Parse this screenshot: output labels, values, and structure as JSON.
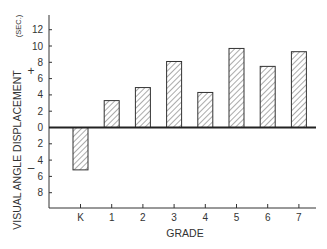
{
  "chart_data": {
    "type": "bar",
    "title": "",
    "xlabel": "GRADE",
    "ylabel": "VISUAL ANGLE DISPLACEMENT",
    "ylabel_unit": "(SEC.)",
    "sign_labels": {
      "positive": "+",
      "negative": "–"
    },
    "categories": [
      "K",
      "1",
      "2",
      "3",
      "4",
      "5",
      "6",
      "7"
    ],
    "values": [
      -5.2,
      3.3,
      4.9,
      8.1,
      4.3,
      9.7,
      7.5,
      9.3
    ],
    "yticks_positive": [
      0,
      2,
      4,
      6,
      8,
      10,
      12
    ],
    "yticks_negative": [
      2,
      4,
      6,
      8
    ],
    "ylim": [
      -10,
      13.5
    ],
    "grid": false,
    "legend": null,
    "bar_fill": "diagonal-hatch",
    "colors": {
      "ink": "#333333",
      "background": "#ffffff"
    }
  }
}
